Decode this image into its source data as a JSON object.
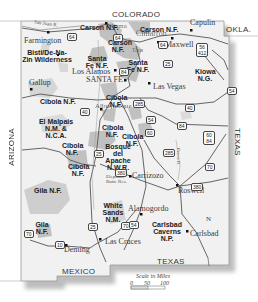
{
  "map": {
    "title": "New Mexico",
    "neighbors": {
      "north": "COLORADO",
      "northeast": "OKLA.",
      "east": "TEXAS",
      "south_east": "TEXAS",
      "south": "MEXICO",
      "west": "ARIZONA"
    },
    "cities": [
      {
        "name": "Farmington"
      },
      {
        "name": "Gallup"
      },
      {
        "name": "Los Alamos"
      },
      {
        "name": "SANTA FE"
      },
      {
        "name": "Las Vegas"
      },
      {
        "name": "Capulin"
      },
      {
        "name": "Maxwell"
      },
      {
        "name": "Cimarron"
      },
      {
        "name": "Taos"
      },
      {
        "name": "Chama"
      },
      {
        "name": "Albuquerque"
      },
      {
        "name": "Carrizozo"
      },
      {
        "name": "Roswell"
      },
      {
        "name": "Alamogordo"
      },
      {
        "name": "Las Cruces"
      },
      {
        "name": "Deming"
      },
      {
        "name": "Carlsbad"
      }
    ],
    "parks": [
      {
        "name": "Carson N.F.",
        "id": "carson-nw"
      },
      {
        "name": "Carson N.F.",
        "id": "carson-ne"
      },
      {
        "name": "Carson N.F.",
        "id": "carson-c"
      },
      {
        "name": "Santa Fe N.F.",
        "id": "santafe-w"
      },
      {
        "name": "Santa Fe N.F.",
        "id": "santafe-e"
      },
      {
        "name": "Bisti/De-Na-Zin Wilderness",
        "id": "bisti"
      },
      {
        "name": "Kiowa N.G.",
        "id": "kiowa"
      },
      {
        "name": "Cibola N.F.",
        "id": "cibola-nw"
      },
      {
        "name": "Cibola N.F.",
        "id": "cibola-alb"
      },
      {
        "name": "Cibola N.F.",
        "id": "cibola-c1"
      },
      {
        "name": "Cibola N.F.",
        "id": "cibola-c2"
      },
      {
        "name": "Cibola N.F.",
        "id": "cibola-w1"
      },
      {
        "name": "Cibola N.F.",
        "id": "cibola-w2"
      },
      {
        "name": "El Malpais N.M. & N.C.A.",
        "id": "malpais"
      },
      {
        "name": "Bosque del Apache N.W.R.",
        "id": "bosque"
      },
      {
        "name": "Gila N.F.",
        "id": "gila1"
      },
      {
        "name": "Gila N.F.",
        "id": "gila2"
      },
      {
        "name": "White Sands N.M.",
        "id": "whitesands"
      },
      {
        "name": "Carlsbad Caverns N.P.",
        "id": "carlsbad"
      }
    ],
    "features": {
      "river": "San Juan R.",
      "desert": "Elephant Butte Res.",
      "rio": "Pecos R."
    },
    "routes": [
      "64",
      "64",
      "64",
      "84",
      "25",
      "25",
      "25",
      "40",
      "40",
      "285",
      "285",
      "285",
      "56 412",
      "54",
      "54",
      "60",
      "60 84",
      "84",
      "380",
      "380",
      "70",
      "70",
      "70",
      "10",
      "54"
    ],
    "scale": {
      "title": "Scale in Miles",
      "ticks": [
        "0",
        "50",
        "100"
      ]
    },
    "north_arrow": "N"
  }
}
